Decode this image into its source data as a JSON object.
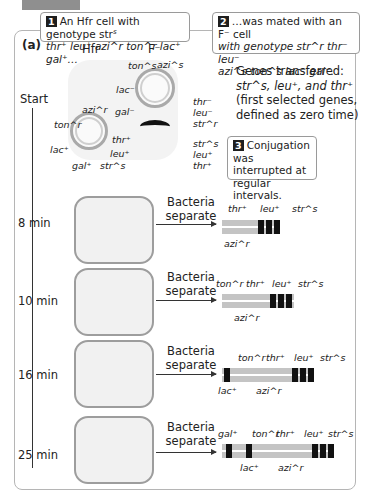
{
  "panel_label": "(a)",
  "callouts": [
    {
      "num": "1",
      "line1": "An Hfr cell with genotype str",
      "line1_sup": "s",
      "line2": "thr⁺ leu⁺ azi^r ton^r lac⁺ gal⁺…"
    },
    {
      "num": "2",
      "line1": "…was mated with an F⁻ cell",
      "line2": "with genotype str^r thr⁻ leu⁻",
      "line3": "azi^s ton^s lac⁻ gal⁻."
    },
    {
      "num": "3",
      "line1": "Conjugation was",
      "line2": "interrupted at",
      "line3": "regular intervals."
    }
  ],
  "cell_labels": {
    "hfr": "Hfr",
    "fminus": "F⁻"
  },
  "hfr_genes": [
    "azi^r",
    "ton^r",
    "lac⁺",
    "gal⁺",
    "str^s",
    "leu⁺",
    "thr⁺"
  ],
  "fminus_genes": [
    "ton^s",
    "azi^s",
    "lac⁻",
    "gal⁻",
    "thr⁻",
    "leu⁻",
    "str^r"
  ],
  "transferred_genes": [
    "str^s",
    "leu⁺",
    "thr⁺"
  ],
  "genes_transferred_note": {
    "line1": "Genes transferred:",
    "line2": "str^s, leu⁺, and thr⁺",
    "line3": "(first selected genes,",
    "line4": "defined as zero time)"
  },
  "timeline": {
    "start_label": "Start",
    "steps": [
      {
        "time": "8 min",
        "action": "Bacteria separate",
        "top_genes": [
          "thr⁺",
          "leu⁺",
          "str^s"
        ],
        "bottom_genes": [
          "azi^r"
        ]
      },
      {
        "time": "10 min",
        "action": "Bacteria separate",
        "top_genes": [
          "ton^r",
          "thr⁺",
          "leu⁺",
          "str^s"
        ],
        "bottom_genes": [
          "azi^r"
        ]
      },
      {
        "time": "16 min",
        "action": "Bacteria separate",
        "top_genes": [
          "ton^r",
          "thr⁺",
          "leu⁺",
          "str^s"
        ],
        "bottom_genes": [
          "lac⁺",
          "azi^r"
        ]
      },
      {
        "time": "25 min",
        "action": "Bacteria separate",
        "top_genes": [
          "gal⁺",
          "ton^r",
          "thr⁺",
          "leu⁺",
          "str^s"
        ],
        "bottom_genes": [
          "lac⁺",
          "azi^r"
        ]
      }
    ]
  },
  "colors": {
    "marker": "#111111",
    "strand": "#c4c4c4",
    "cell_fill": "#f1f1f1",
    "cell_border": "#9d9d9d",
    "frame": "#b5b5b5"
  }
}
